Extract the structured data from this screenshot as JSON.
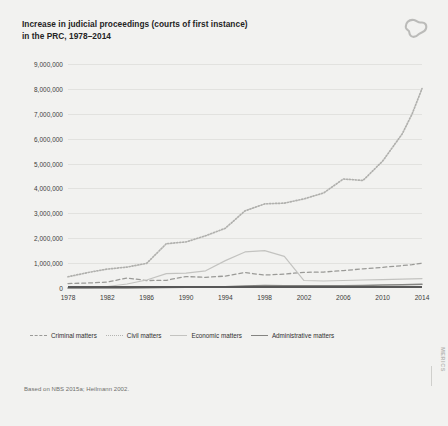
{
  "header": {
    "title_line1": "Increase in judicial proceedings (courts of first instance)",
    "title_line2": "in the PRC, 1978–2014",
    "logo_name": "merics-logo"
  },
  "footer": {
    "source": "Based on NBS 2015a; Heilmann 2002.",
    "edge_brand": "MERICS"
  },
  "chart_data": {
    "type": "line",
    "title": "Increase in judicial proceedings (courts of first instance) in the PRC, 1978–2014",
    "xlabel": "",
    "ylabel": "",
    "grid": true,
    "legend_position": "bottom",
    "xlim": [
      1978,
      2014
    ],
    "ylim": [
      0,
      9000000
    ],
    "ytick_labels": [
      "9,000,000",
      "8,000,000",
      "7,000,000",
      "6,000,000",
      "5,000,000",
      "4,000,000",
      "3,000,000",
      "2,000,000",
      "1,000,000",
      "0"
    ],
    "yticks": [
      9000000,
      8000000,
      7000000,
      6000000,
      5000000,
      4000000,
      3000000,
      2000000,
      1000000,
      0
    ],
    "xtick_labels": [
      "1978",
      "1982",
      "1986",
      "1990",
      "1994",
      "1998",
      "2002",
      "2006",
      "2010",
      "2014"
    ],
    "xticks": [
      1978,
      1982,
      1986,
      1990,
      1994,
      1998,
      2002,
      2006,
      2010,
      2014
    ],
    "x": [
      1978,
      1980,
      1982,
      1984,
      1986,
      1988,
      1990,
      1992,
      1994,
      1996,
      1998,
      2000,
      2002,
      2004,
      2006,
      2008,
      2010,
      2012,
      2013,
      2014
    ],
    "series": [
      {
        "name": "Criminal matters",
        "style": "dashed",
        "color": "#9a9a97",
        "values": [
          180000,
          200000,
          240000,
          400000,
          300000,
          310000,
          460000,
          430000,
          480000,
          620000,
          520000,
          560000,
          630000,
          640000,
          700000,
          770000,
          830000,
          900000,
          940000,
          1000000
        ]
      },
      {
        "name": "Civil matters",
        "style": "dotted",
        "color": "#b0b0ad",
        "values": [
          450000,
          620000,
          760000,
          840000,
          990000,
          1780000,
          1850000,
          2100000,
          2400000,
          3100000,
          3380000,
          3410000,
          3580000,
          3820000,
          4380000,
          4320000,
          5100000,
          6200000,
          7000000,
          8010000
        ]
      },
      {
        "name": "Economic matters",
        "style": "solid-light",
        "color": "#c3c3c0",
        "values": [
          0,
          0,
          60000,
          160000,
          320000,
          580000,
          600000,
          690000,
          1100000,
          1450000,
          1500000,
          1270000,
          300000,
          280000,
          300000,
          320000,
          340000,
          360000,
          370000,
          380000
        ]
      },
      {
        "name": "Administrative matters",
        "style": "solid",
        "color": "#848481",
        "values": [
          0,
          0,
          0,
          0,
          10000,
          20000,
          30000,
          40000,
          50000,
          80000,
          100000,
          90000,
          90000,
          90000,
          90000,
          100000,
          120000,
          130000,
          140000,
          150000
        ]
      }
    ]
  }
}
